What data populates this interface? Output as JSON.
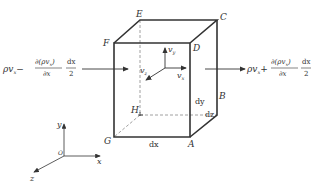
{
  "figure": {
    "type": "control-volume-diagram",
    "vertices": {
      "A": "A",
      "B": "B",
      "C": "C",
      "D": "D",
      "E": "E",
      "F": "F",
      "G": "G",
      "H": "H"
    },
    "dimensions": {
      "dx": "dx",
      "dy": "dy",
      "dz": "dz"
    },
    "velocity_labels": {
      "vx": "v",
      "vx_sub": "x",
      "vy": "v",
      "vy_sub": "y",
      "vz": "v",
      "vz_sub": "z"
    },
    "inflow": {
      "lhs": "ρv",
      "lhs_sub": "x",
      "sign": "−",
      "numerator": "∂(ρv",
      "numerator_sub": "x",
      "numerator_close": ")",
      "denominator": "∂x",
      "frac2_num": "dx",
      "frac2_den": "2"
    },
    "outflow": {
      "lhs": "ρv",
      "lhs_sub": "x",
      "sign": "+",
      "numerator": "∂(ρv",
      "numerator_sub": "x",
      "numerator_close": ")",
      "denominator": "∂x",
      "frac2_num": "dx",
      "frac2_den": "2"
    },
    "axes": {
      "x": "x",
      "y": "y",
      "z": "z",
      "origin": "O"
    },
    "colors": {
      "line": "#333333",
      "dashed": "#888888"
    }
  }
}
